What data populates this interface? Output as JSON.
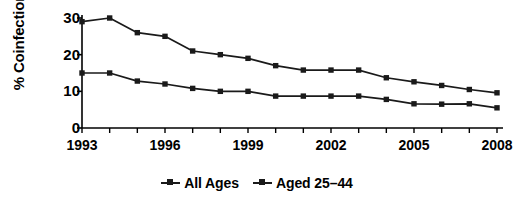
{
  "chart_data": {
    "type": "line",
    "title": "",
    "xlabel": "",
    "ylabel": "% Coinfection",
    "ylim": [
      0,
      30
    ],
    "yticks": [
      0,
      10,
      20,
      30
    ],
    "grid": false,
    "legend_position": "bottom",
    "x": [
      1993,
      1994,
      1995,
      1996,
      1997,
      1998,
      1999,
      2000,
      2001,
      2002,
      2003,
      2004,
      2005,
      2006,
      2007,
      2008
    ],
    "xtick_labels": [
      "1993",
      "1996",
      "1999",
      "2002",
      "2005",
      "2008"
    ],
    "xtick_values": [
      1993,
      1996,
      1999,
      2002,
      2005,
      2008
    ],
    "series": [
      {
        "name": "All Ages",
        "color": "#1a1a1a",
        "marker": "square",
        "values": [
          29,
          30,
          26,
          25,
          21,
          20,
          19,
          17,
          15.8,
          15.8,
          15.8,
          13.7,
          12.6,
          11.6,
          10.5,
          9.6
        ]
      },
      {
        "name": "Aged 25–44",
        "color": "#1a1a1a",
        "marker": "square",
        "values": [
          15,
          15,
          12.8,
          12,
          10.8,
          10,
          10,
          8.7,
          8.7,
          8.7,
          8.7,
          7.8,
          6.6,
          6.5,
          6.6,
          5.5
        ]
      }
    ]
  },
  "legend": {
    "entries": [
      {
        "label": "All Ages"
      },
      {
        "label": "Aged 25–44"
      }
    ]
  },
  "axes": {
    "y_title": "% Coinfection",
    "y_tick_labels": [
      "30",
      "20",
      "10",
      "0"
    ]
  }
}
